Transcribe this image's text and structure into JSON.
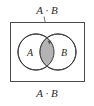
{
  "figure": {
    "type": "venn-diagram",
    "callout_label": "A · B",
    "caption_label": "A · B",
    "set_a_label": "A",
    "set_b_label": "B",
    "universe": {
      "shape": "rectangle",
      "border_color": "#4a4a4a",
      "fill_color": "#ffffff"
    },
    "circles": [
      {
        "name": "A",
        "label": "A",
        "cx": 36,
        "cy": 52,
        "r": 18,
        "stroke": "#3a3a3a",
        "fill": "#ffffff"
      },
      {
        "name": "B",
        "label": "B",
        "cx": 58,
        "cy": 52,
        "r": 18,
        "stroke": "#3a3a3a",
        "fill": "#ffffff"
      }
    ],
    "intersection": {
      "shaded": true,
      "fill_color": "#b3b3b3",
      "stroke_color": "#3a3a3a"
    },
    "leader_line": {
      "from_x": 44,
      "from_y": 16,
      "to_x": 49,
      "to_y": 42,
      "color": "#4a4a4a"
    }
  }
}
